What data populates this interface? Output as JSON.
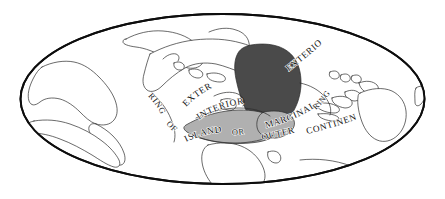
{
  "figure": {
    "background_color": "#ffffff",
    "frame": {
      "shape": "ellipse",
      "center_x": 222.5,
      "center_y": 99,
      "radius_x": 203,
      "radius_y": 86,
      "stroke_color": "#0d0d0d",
      "fill_color": "#ffffff"
    }
  },
  "palette": {
    "outline": "#2b2b2b",
    "frame_stroke": "#0d0d0d",
    "paper": "#ffffff",
    "interior_dark_fill": "#4a4a4a",
    "interior_light_fill": "#b0b0b0",
    "label_text": "#141414"
  },
  "regions": [
    {
      "id": "heartland-core",
      "name": "Interior core region",
      "fill": "#4a4a4a",
      "shade": "dark"
    },
    {
      "id": "interior-belt",
      "name": "Interior belt region",
      "fill": "#b0b0b0",
      "shade": "light"
    },
    {
      "id": "marginal-lobe",
      "name": "Marginal lobe region",
      "fill": "#b0b0b0",
      "shade": "light"
    }
  ],
  "labels": {
    "exterior_upper_right": "EXTERIOR",
    "exterior_center": "EXTERIOR",
    "interior_center": "INTERIOR",
    "marginal": "MARGINAL",
    "ring_left": "RING",
    "of_left": "OF",
    "islands": "ISLANDS",
    "or": "OR",
    "outer": "OUTER",
    "continents": "CONTINENTS",
    "ring_right": "RING"
  }
}
